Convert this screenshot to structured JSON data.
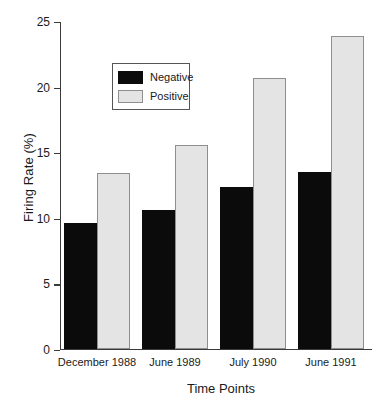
{
  "chart_data": {
    "type": "bar",
    "title": "",
    "xlabel": "Time Points",
    "ylabel": "Firing Rate (%)",
    "categories": [
      "December 1988",
      "June 1989",
      "July 1990",
      "June 1991"
    ],
    "series": [
      {
        "name": "Negative",
        "color": "#0b0b0b",
        "values": [
          9.6,
          10.6,
          12.3,
          13.5
        ]
      },
      {
        "name": "Positive",
        "color": "#e4e4e4",
        "values": [
          13.4,
          15.5,
          20.6,
          23.8
        ]
      }
    ],
    "ylim": [
      0,
      25
    ],
    "yticks": [
      0,
      5,
      10,
      15,
      20,
      25
    ],
    "ytick_labels": [
      "0",
      "5",
      "10",
      "15",
      "20",
      "25"
    ],
    "grid": false,
    "legend_position": "upper left",
    "legend_entries": [
      "Negative",
      "Positive"
    ]
  }
}
